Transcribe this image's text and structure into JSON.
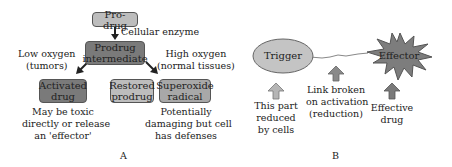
{
  "panel_a": {
    "label": "A",
    "prodrug": "Pro-drug",
    "enzyme_label": "Cellular enzyme",
    "intermediate_line1": "Prodrug",
    "intermediate_line2": "intermediate",
    "low_oxygen_line1": "Low oxygen",
    "low_oxygen_line2": "(tumors)",
    "high_oxygen_line1": "High oxygen",
    "high_oxygen_line2": "(normal tissues)",
    "activated_line1": "Activated",
    "activated_line2": "drug",
    "restored_line1": "Restored",
    "restored_line2": "prodrug",
    "superoxide_line1": "Superoxide",
    "superoxide_line2": "radical",
    "activated_note": [
      "May be toxic",
      "directly or release",
      "an 'effector'"
    ],
    "superoxide_note": [
      "Potentially",
      "damaging but cell",
      "has defenses"
    ]
  },
  "panel_b": {
    "label": "B",
    "trigger": "Trigger",
    "effector": "Effector",
    "trigger_note": [
      "This part",
      "reduced",
      "by cells"
    ],
    "link_note": [
      "Link broken",
      "on activation",
      "(reduction)"
    ],
    "effector_note": [
      "Effective",
      "drug"
    ]
  },
  "colors": {
    "light_box": "#bdbdbd",
    "dark_box": "#7a7a7a",
    "trigger_fill": "#c4c4c4",
    "effector_fill": "#7d7d7d",
    "arrow_light": "#b5b5b5",
    "arrow_dark": "#7a7a7a"
  }
}
